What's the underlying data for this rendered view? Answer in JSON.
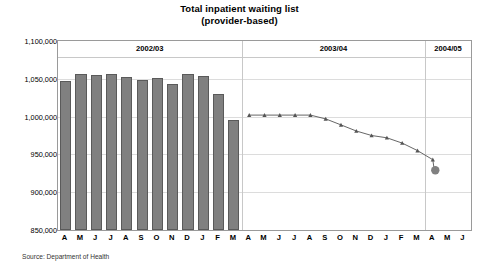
{
  "chart_data": {
    "type": "bar",
    "title": "Total inpatient waiting list",
    "subtitle": "(provider-based)",
    "xlabel": "",
    "ylabel": "",
    "ylim": [
      850000,
      1100000
    ],
    "ytick_step": 50000,
    "ytick_labels": [
      "1,100,000",
      "1,050,000",
      "1,000,000",
      "950,000",
      "900,000",
      "850,000"
    ],
    "ytick_values": [
      1100000,
      1050000,
      1000000,
      950000,
      900000,
      850000
    ],
    "grid": true,
    "legend": "none",
    "source": "Source: Department of Health",
    "categories": [
      "A",
      "M",
      "J",
      "J",
      "A",
      "S",
      "O",
      "N",
      "D",
      "J",
      "F",
      "M",
      "A",
      "M",
      "J",
      "J",
      "A",
      "S",
      "O",
      "N",
      "D",
      "J",
      "F",
      "M",
      "A",
      "M",
      "J"
    ],
    "year_bands": [
      {
        "label": "2002/03",
        "start_index": 0,
        "end_index": 11
      },
      {
        "label": "2003/04",
        "start_index": 12,
        "end_index": 23
      },
      {
        "label": "2004/05",
        "start_index": 24,
        "end_index": 26
      }
    ],
    "series": [
      {
        "name": "Actual (bars)",
        "render": "bar",
        "color": "#808080",
        "values": [
          1047000,
          1057000,
          1055000,
          1056000,
          1053000,
          1048000,
          1051000,
          1043000,
          1057000,
          1054000,
          1030000,
          995000,
          null,
          null,
          null,
          null,
          null,
          null,
          null,
          null,
          null,
          null,
          null,
          null,
          null,
          null,
          null
        ]
      },
      {
        "name": "Planned trajectory (line)",
        "render": "line",
        "color": "#555555",
        "marker": "triangle",
        "values": [
          null,
          null,
          null,
          null,
          null,
          null,
          null,
          null,
          null,
          null,
          null,
          null,
          1002000,
          1002000,
          1002000,
          1002000,
          1002000,
          997000,
          989000,
          981000,
          975000,
          972000,
          965000,
          955000,
          943000,
          null,
          null
        ]
      },
      {
        "name": "End point",
        "render": "point",
        "color": "#808080",
        "marker": "circle",
        "index": 24,
        "value": 929000
      }
    ]
  },
  "colors": {
    "bar_fill": "#808080",
    "bar_border": "#5a5a5a",
    "line": "#555555",
    "grid": "#dcdcdc",
    "frame": "#9a9a9a",
    "text": "#000000"
  }
}
